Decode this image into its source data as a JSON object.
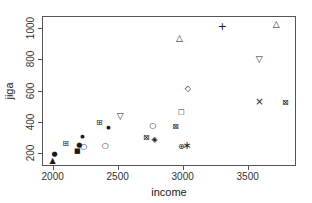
{
  "colors": {
    "foreground": "#1a1a1a",
    "axis": "#555555",
    "background": "#ffffff"
  },
  "chart_data": {
    "type": "scatter",
    "title": "",
    "xlabel": "income",
    "ylabel": "jiga",
    "xlim": [
      1918,
      3872
    ],
    "ylim": [
      118,
      1078
    ],
    "xticks": [
      2000,
      2500,
      3000,
      3500
    ],
    "yticks": [
      200,
      400,
      600,
      800,
      1000
    ],
    "grid": false,
    "legend": "none",
    "series": [
      {
        "name": "filled-triangle-up",
        "glyph": "▲",
        "size": 8,
        "points": [
          [
            2000,
            150
          ]
        ]
      },
      {
        "name": "filled-circle",
        "glyph": "●",
        "size": 7,
        "points": [
          [
            2015,
            192
          ],
          [
            2205,
            250
          ]
        ]
      },
      {
        "name": "filled-circle-small",
        "glyph": "●",
        "size": 5,
        "points": [
          [
            2230,
            313
          ],
          [
            2430,
            365
          ]
        ]
      },
      {
        "name": "square-plus",
        "glyph": "⊞",
        "size": 8,
        "points": [
          [
            2100,
            260
          ],
          [
            2360,
            393
          ]
        ]
      },
      {
        "name": "open-circle",
        "glyph": "○",
        "size": 8,
        "points": [
          [
            2240,
            238
          ],
          [
            2405,
            245
          ],
          [
            2770,
            375
          ]
        ]
      },
      {
        "name": "filled-square",
        "glyph": "■",
        "size": 7,
        "points": [
          [
            2190,
            215
          ]
        ]
      },
      {
        "name": "open-triangle-down",
        "glyph": "▽",
        "size": 9,
        "points": [
          [
            2520,
            435
          ],
          [
            3590,
            805
          ]
        ]
      },
      {
        "name": "square-x",
        "glyph": "⊠",
        "size": 8,
        "points": [
          [
            2720,
            297
          ],
          [
            2945,
            370
          ],
          [
            3790,
            520
          ]
        ]
      },
      {
        "name": "diamond-plus",
        "glyph": "◈",
        "size": 8,
        "points": [
          [
            2785,
            282
          ]
        ]
      },
      {
        "name": "open-triangle-up",
        "glyph": "△",
        "size": 9,
        "points": [
          [
            2975,
            935
          ],
          [
            3720,
            1030
          ]
        ]
      },
      {
        "name": "open-diamond",
        "glyph": "◇",
        "size": 8,
        "points": [
          [
            3040,
            612
          ]
        ]
      },
      {
        "name": "open-square",
        "glyph": "□",
        "size": 7,
        "points": [
          [
            2990,
            465
          ]
        ]
      },
      {
        "name": "circle-plus",
        "glyph": "⊕",
        "size": 8,
        "points": [
          [
            2990,
            242
          ]
        ]
      },
      {
        "name": "asterisk",
        "glyph": "∗",
        "size": 11,
        "points": [
          [
            3035,
            252
          ]
        ]
      },
      {
        "name": "plus",
        "glyph": "+",
        "size": 11,
        "points": [
          [
            3305,
            1015
          ]
        ]
      },
      {
        "name": "x-cross",
        "glyph": "×",
        "size": 10,
        "points": [
          [
            3590,
            525
          ]
        ]
      }
    ],
    "plot_box_px": {
      "left": 42,
      "top": 16,
      "width": 254,
      "height": 150
    }
  }
}
